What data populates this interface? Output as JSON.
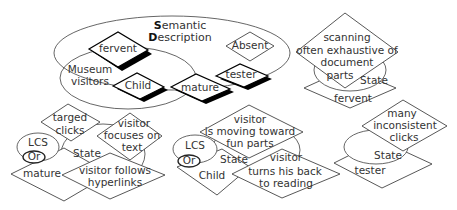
{
  "semantic_description": {
    "title_line1_initial": "S",
    "title_line1_rest": "emantic",
    "title_line2_initial": "D",
    "title_line2_rest": "escription",
    "group_label_line1": "Museum",
    "group_label_line2": "visitors",
    "nodes": {
      "fervent": "fervent",
      "child": "Child",
      "mature": "mature",
      "absent": "Absent",
      "tester": "tester"
    }
  },
  "panel_scanning": {
    "action_lines": [
      "scanning",
      "often exhaustive of",
      "document",
      "parts"
    ],
    "state_label": "State",
    "profile": "fervent"
  },
  "panel_mature": {
    "lcs_label": "LCS",
    "or_label": "Or",
    "state_label": "State",
    "profile": "mature",
    "actions": [
      {
        "lines": [
          "targed",
          "clicks"
        ]
      },
      {
        "lines": [
          "visitor",
          "focuses on",
          "text"
        ]
      },
      {
        "lines": [
          "visitor follows",
          "hyperlinks"
        ]
      }
    ]
  },
  "panel_child": {
    "lcs_label": "LCS",
    "or_label": "Or",
    "state_label": "State",
    "profile": "Child",
    "actions": [
      {
        "lines": [
          "visitor",
          "is moving toward",
          "fun parts"
        ]
      },
      {
        "lines": [
          "visitor",
          "turns his back",
          "to reading"
        ]
      }
    ]
  },
  "panel_tester": {
    "action_lines": [
      "many",
      "inconsistent",
      "clicks"
    ],
    "state_label": "State",
    "profile": "tester"
  }
}
